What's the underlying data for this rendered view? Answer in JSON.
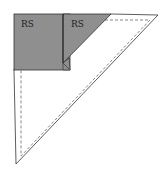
{
  "diagram": {
    "type": "sewing-fold-diagram",
    "labels": {
      "left_square": "RS",
      "right_triangle": "RS"
    },
    "colors": {
      "fabric_rs": "#8f8f8f",
      "fabric_ws": "#ffffff",
      "outline": "#333333",
      "seam_line": "#555555"
    }
  }
}
